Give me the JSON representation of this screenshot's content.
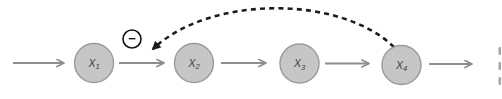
{
  "diagram": {
    "background": "#ffffff",
    "node_style": {
      "fill": "#c6c6c6",
      "stroke": "#9b9b9b",
      "stroke_width": 1.4,
      "radius": 19.5,
      "label_color": "#3c3c3c",
      "label_size": 10.5,
      "sub_size": 7.5
    },
    "nodes": [
      {
        "name": "x1",
        "base": "X",
        "sub": "1",
        "cx": 94,
        "cy": 63
      },
      {
        "name": "x2",
        "base": "X",
        "sub": "2",
        "cx": 194,
        "cy": 63
      },
      {
        "name": "x3",
        "base": "X",
        "sub": "3",
        "cx": 299.5,
        "cy": 63.5
      },
      {
        "name": "x4",
        "base": "X",
        "sub": "4",
        "cx": 401.5,
        "cy": 65
      }
    ],
    "flow_arrows": {
      "color": "#8d8d8d",
      "stroke_width": 2,
      "segments": [
        {
          "name": "into-x1",
          "x1": 13,
          "y1": 63,
          "x2": 64,
          "y2": 63
        },
        {
          "name": "x1-to-x2",
          "x1": 119,
          "y1": 63,
          "x2": 164,
          "y2": 63
        },
        {
          "name": "x2-to-x3",
          "x1": 221,
          "y1": 63,
          "x2": 266,
          "y2": 63
        },
        {
          "name": "x3-to-x4",
          "x1": 325,
          "y1": 63.5,
          "x2": 369,
          "y2": 63.5
        },
        {
          "name": "out-of-x4",
          "x1": 429,
          "y1": 64,
          "x2": 472,
          "y2": 64
        }
      ]
    },
    "feedback_arc": {
      "from": "x4",
      "to": "x1-x2-link",
      "color": "#1c1c1c",
      "stroke_width": 2.6,
      "dash": "5 4.2",
      "path": "M 394 47 C 340 -5 210 -5 153 49"
    },
    "sign_badge": {
      "symbol": "−",
      "cx": 132,
      "cy": 39,
      "r": 9,
      "fill": "#ffffff",
      "stroke": "#111111",
      "stroke_width": 1.6
    },
    "cropped_edge_marks": {
      "color": "#a6a6a6",
      "marks": [
        {
          "x": 498.5,
          "y": 47,
          "w": 2.5,
          "h": 8
        },
        {
          "x": 498.5,
          "y": 62,
          "w": 2.5,
          "h": 8
        },
        {
          "x": 498.5,
          "y": 77,
          "w": 2.5,
          "h": 8
        }
      ]
    }
  }
}
